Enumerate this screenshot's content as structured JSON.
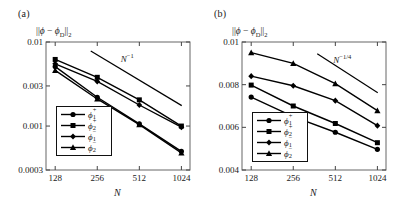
{
  "figure": {
    "panels": [
      {
        "label": "(a)",
        "ylabel_prefix": "||",
        "ylabel_phi": "ϕ",
        "ylabel_minus": " − ",
        "ylabel_phiD": "ϕ",
        "ylabel_Dsub": "D",
        "ylabel_suffix": "||2",
        "xlabel": "N",
        "slope_annotation": "N",
        "slope_exponent": "−1",
        "yticks": [
          "0.01",
          "0.003",
          "0.001",
          "0.0003"
        ],
        "xticks": [
          "128",
          "256",
          "512",
          "1024"
        ],
        "legend": [
          {
            "label": "ϕ",
            "sub": "1",
            "sup": "+",
            "marker": "circle"
          },
          {
            "label": "ϕ",
            "sub": "2",
            "sup": "+",
            "marker": "square"
          },
          {
            "label": "ϕ",
            "sub": "1",
            "sup": "−",
            "marker": "diamond"
          },
          {
            "label": "ϕ",
            "sub": "2",
            "sup": "−",
            "marker": "triangle"
          }
        ]
      },
      {
        "label": "(b)",
        "ylabel_prefix": "||",
        "ylabel_phi": "ϕ",
        "ylabel_minus": " − ",
        "ylabel_phiD": "ϕ",
        "ylabel_Dsub": "D",
        "ylabel_suffix": "||2",
        "xlabel": "N",
        "slope_annotation": "N",
        "slope_exponent": "−1/4",
        "yticks": [
          "0.01",
          "0.008",
          "0.006",
          "0.004"
        ],
        "xticks": [
          "128",
          "256",
          "512",
          "1024"
        ],
        "legend": [
          {
            "label": "ϕ",
            "sub": "1",
            "sup": "+",
            "marker": "circle"
          },
          {
            "label": "ϕ",
            "sub": "2",
            "sup": "+",
            "marker": "square"
          },
          {
            "label": "ϕ",
            "sub": "1",
            "sup": "−",
            "marker": "diamond"
          },
          {
            "label": "ϕ",
            "sub": "2",
            "sup": "−",
            "marker": "triangle"
          }
        ]
      }
    ]
  },
  "chart_data": [
    {
      "type": "line",
      "panel": "(a)",
      "title": "",
      "xlabel": "N",
      "ylabel": "||ϕ − ϕ_D||₂",
      "xscale": "log2",
      "yscale": "log10",
      "x": [
        128,
        256,
        512,
        1024
      ],
      "xticks": [
        128,
        256,
        512,
        1024
      ],
      "yticks": [
        0.01,
        0.003,
        0.001,
        0.0003
      ],
      "xlim": [
        110,
        1180
      ],
      "ylim": [
        0.0003,
        0.01
      ],
      "grid": false,
      "legend_position": "lower-left",
      "reference_line": {
        "label": "N^-1",
        "slope": -1,
        "x": [
          230,
          1030
        ],
        "y": [
          0.0078,
          0.00175
        ]
      },
      "series": [
        {
          "name": "ϕ1⁺",
          "marker": "circle",
          "values": [
            0.0051,
            0.0022,
            0.00106,
            0.0005
          ]
        },
        {
          "name": "ϕ2⁺",
          "marker": "square",
          "values": [
            0.0062,
            0.0038,
            0.00205,
            0.001
          ]
        },
        {
          "name": "ϕ1⁻",
          "marker": "diamond",
          "values": [
            0.0055,
            0.0034,
            0.00178,
            0.00097
          ]
        },
        {
          "name": "ϕ2⁻",
          "marker": "triangle",
          "values": [
            0.0046,
            0.0021,
            0.00104,
            0.00048
          ]
        }
      ]
    },
    {
      "type": "line",
      "panel": "(b)",
      "title": "",
      "xlabel": "N",
      "ylabel": "||ϕ − ϕ_D||₂",
      "xscale": "log2",
      "yscale": "linear",
      "x": [
        128,
        256,
        512,
        1024
      ],
      "xticks": [
        128,
        256,
        512,
        1024
      ],
      "yticks": [
        0.01,
        0.008,
        0.006,
        0.004
      ],
      "xlim": [
        110,
        1180
      ],
      "ylim": [
        0.004,
        0.01
      ],
      "grid": false,
      "legend_position": "lower-left",
      "reference_line": {
        "label": "N^-1/4",
        "slope": -0.25,
        "x": [
          380,
          1030
        ],
        "y": [
          0.00945,
          0.00762
        ]
      },
      "series": [
        {
          "name": "ϕ1⁺",
          "marker": "circle",
          "values": [
            0.00742,
            0.0065,
            0.00577,
            0.00497
          ]
        },
        {
          "name": "ϕ2⁺",
          "marker": "square",
          "values": [
            0.00798,
            0.007,
            0.00618,
            0.00528
          ]
        },
        {
          "name": "ϕ1⁻",
          "marker": "diamond",
          "values": [
            0.0084,
            0.00795,
            0.00725,
            0.00608
          ]
        },
        {
          "name": "ϕ2⁻",
          "marker": "triangle",
          "values": [
            0.0095,
            0.009,
            0.00805,
            0.00678
          ]
        }
      ]
    }
  ]
}
